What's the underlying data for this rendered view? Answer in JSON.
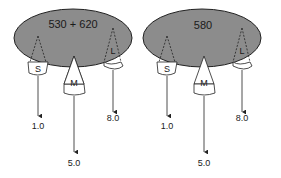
{
  "diagrams": [
    {
      "title": "530 + 620",
      "cones": [
        {
          "label": "S",
          "value": "1.0"
        },
        {
          "label": "M",
          "value": "5.0"
        },
        {
          "label": "L",
          "value": "8.0"
        }
      ]
    },
    {
      "title": "580",
      "cones": [
        {
          "label": "S",
          "value": "1.0"
        },
        {
          "label": "M",
          "value": "5.0"
        },
        {
          "label": "L",
          "value": "8.0"
        }
      ]
    }
  ],
  "colors": {
    "ellipse_fill": "#8c8c8c",
    "stroke": "#222222",
    "background": "#ffffff"
  }
}
